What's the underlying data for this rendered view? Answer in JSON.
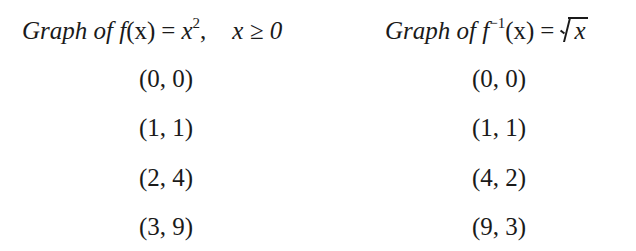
{
  "left_column": {
    "heading": {
      "prefix": "Graph of ",
      "func": "f",
      "arg": "(x)",
      "equals": "=",
      "rhs_base": "x",
      "rhs_exp": "2",
      "comma": ",",
      "condition": "x ≥ 0"
    },
    "points": [
      "(0, 0)",
      "(1, 1)",
      "(2, 4)",
      "(3, 9)"
    ]
  },
  "right_column": {
    "heading": {
      "prefix": "Graph of ",
      "func": "f",
      "exp": "−1",
      "arg": "(x)",
      "equals": "=",
      "rhs": "x"
    },
    "points": [
      "(0, 0)",
      "(1, 1)",
      "(4, 2)",
      "(9, 3)"
    ]
  }
}
